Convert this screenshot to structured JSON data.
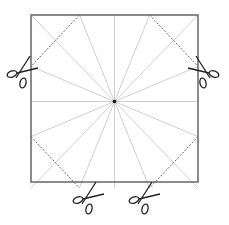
{
  "diagram": {
    "square": {
      "x": 31,
      "y": 15,
      "size": 167,
      "stroke": "#6e6e6e"
    },
    "center": {
      "x": 114.5,
      "y": 101.5
    },
    "ray_color": "#c8c8c8",
    "dash_color": "#555555",
    "rays": [
      [
        114.5,
        15
      ],
      [
        149.6,
        15
      ],
      [
        198,
        15
      ],
      [
        198,
        66.4
      ],
      [
        198,
        101.5
      ],
      [
        198,
        136.6
      ],
      [
        198,
        188
      ],
      [
        149.6,
        188
      ],
      [
        114.5,
        188
      ],
      [
        79.4,
        188
      ],
      [
        31,
        188
      ],
      [
        31,
        136.6
      ],
      [
        31,
        101.5
      ],
      [
        31,
        66.4
      ],
      [
        31,
        15
      ],
      [
        79.4,
        15
      ]
    ],
    "cut_lines": [
      {
        "name": "top-left",
        "from": [
          79.4,
          15
        ],
        "to": [
          31,
          66.4
        ]
      },
      {
        "name": "top-right",
        "from": [
          149.6,
          15
        ],
        "to": [
          198,
          66.4
        ]
      },
      {
        "name": "bottom-left",
        "from": [
          31,
          136.6
        ],
        "to": [
          79.4,
          188
        ]
      },
      {
        "name": "bottom-right",
        "from": [
          198,
          136.6
        ],
        "to": [
          149.6,
          188
        ]
      }
    ],
    "scissors": [
      {
        "name": "left",
        "x": 18,
        "y": 72,
        "rotate": 0
      },
      {
        "name": "right",
        "x": 208,
        "y": 72,
        "rotate": 0,
        "mirror": true
      },
      {
        "name": "bottom-left",
        "x": 84,
        "y": 198,
        "rotate": 0
      },
      {
        "name": "bottom-right",
        "x": 140,
        "y": 198,
        "rotate": 0
      }
    ]
  }
}
